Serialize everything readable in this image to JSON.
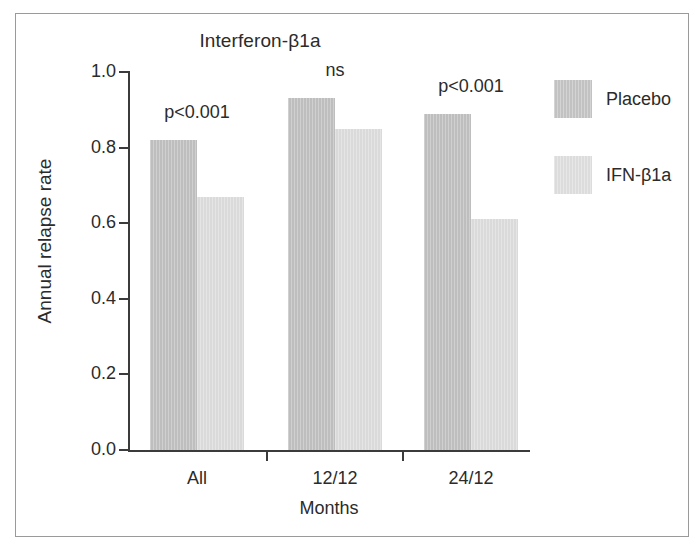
{
  "figure": {
    "border_color": "#9a9a9a",
    "background": "#ffffff"
  },
  "chart_data": {
    "type": "bar",
    "title": "Interferon-β1a",
    "xlabel": "Months",
    "ylabel": "Annual relapse rate",
    "categories": [
      "All",
      "12/12",
      "24/12"
    ],
    "series": [
      {
        "name": "Placebo",
        "color": "#bebebe",
        "values": [
          0.82,
          0.93,
          0.89
        ]
      },
      {
        "name": "IFN-β1a",
        "color": "#dadada",
        "values": [
          0.67,
          0.85,
          0.61
        ]
      }
    ],
    "annotations": [
      "p<0.001",
      "ns",
      "p<0.001"
    ],
    "ylim": [
      0.0,
      1.0
    ],
    "yticks": [
      0.0,
      0.2,
      0.4,
      0.6,
      0.8,
      1.0
    ],
    "ytick_labels": [
      "0.0",
      "0.2",
      "0.4",
      "0.6",
      "0.8",
      "1.0"
    ],
    "grid": false,
    "legend_position": "right"
  },
  "legend": {
    "entries": [
      {
        "label": "Placebo",
        "color": "#c2c2c2"
      },
      {
        "label": "IFN-β1a",
        "color": "#dcdcdc"
      }
    ]
  }
}
